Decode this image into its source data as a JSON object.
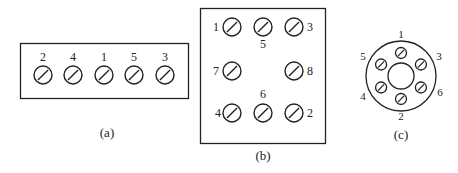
{
  "diagram": {
    "colors": {
      "stroke": "#222222",
      "background": "#ffffff"
    },
    "panel_a": {
      "caption": "(a)",
      "terminals": [
        {
          "label": "2",
          "x": 43
        },
        {
          "label": "4",
          "x": 73
        },
        {
          "label": "1",
          "x": 104
        },
        {
          "label": "5",
          "x": 134
        },
        {
          "label": "3",
          "x": 165
        }
      ]
    },
    "panel_b": {
      "caption": "(b)",
      "terminals": [
        {
          "label": "1",
          "x": 232,
          "y": 27,
          "lx": 216,
          "ly": 31
        },
        {
          "label": "5",
          "x": 263,
          "y": 27,
          "lx": 263,
          "ly": 48
        },
        {
          "label": "3",
          "x": 294,
          "y": 27,
          "lx": 310,
          "ly": 31
        },
        {
          "label": "7",
          "x": 232,
          "y": 71,
          "lx": 216,
          "ly": 75
        },
        {
          "label": "8",
          "x": 294,
          "y": 71,
          "lx": 310,
          "ly": 75
        },
        {
          "label": "4",
          "x": 232,
          "y": 113,
          "lx": 218,
          "ly": 117
        },
        {
          "label": "6",
          "x": 263,
          "y": 113,
          "lx": 263,
          "ly": 98
        },
        {
          "label": "2",
          "x": 294,
          "y": 113,
          "lx": 310,
          "ly": 117
        }
      ]
    },
    "panel_c": {
      "caption": "(c)",
      "terminals": [
        {
          "label": "1",
          "angle": -90,
          "lx": 401,
          "ly": 38
        },
        {
          "label": "3",
          "angle": -30,
          "lx": 439,
          "ly": 60
        },
        {
          "label": "6",
          "angle": 30,
          "lx": 440,
          "ly": 96
        },
        {
          "label": "2",
          "angle": 90,
          "lx": 401,
          "ly": 120
        },
        {
          "label": "4",
          "angle": 150,
          "lx": 363,
          "ly": 100
        },
        {
          "label": "5",
          "angle": 210,
          "lx": 363,
          "ly": 60
        }
      ]
    }
  }
}
